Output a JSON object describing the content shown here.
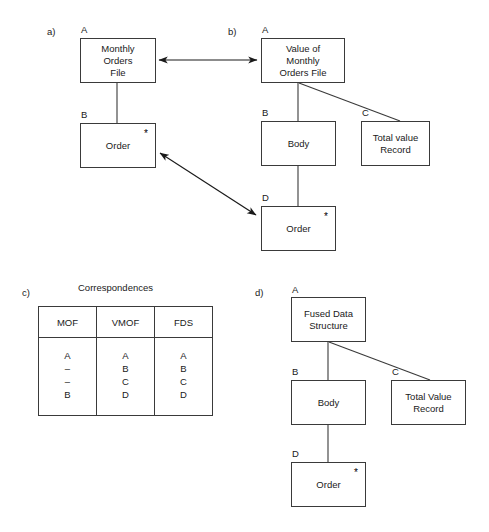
{
  "figure": {
    "background_color": "#ffffff",
    "line_color": "#3a3a3a",
    "text_color": "#1a1a1a"
  },
  "panels": {
    "a": {
      "tag": "a)",
      "nodes": [
        {
          "tag": "A",
          "label": "Monthly\nOrders\nFile",
          "star": false
        },
        {
          "tag": "B",
          "label": "Order",
          "star": true
        }
      ]
    },
    "b": {
      "tag": "b)",
      "nodes": [
        {
          "tag": "A",
          "label": "Value of\nMonthly\nOrders File",
          "star": false
        },
        {
          "tag": "B",
          "label": "Body",
          "star": false
        },
        {
          "tag": "C",
          "label": "Total value\nRecord",
          "star": false
        },
        {
          "tag": "D",
          "label": "Order",
          "star": true
        }
      ]
    },
    "c": {
      "tag": "c)",
      "title": "Correspondences",
      "table": {
        "headers": [
          "MOF",
          "VMOF",
          "FDS"
        ],
        "columns": [
          {
            "name": "MOF",
            "values": [
              "A",
              "–",
              "–",
              "B"
            ]
          },
          {
            "name": "VMOF",
            "values": [
              "A",
              "B",
              "C",
              "D"
            ]
          },
          {
            "name": "FDS",
            "values": [
              "A",
              "B",
              "C",
              "D"
            ]
          }
        ],
        "cells": [
          "A\n–\n–\nB",
          "A\nB\nC\nD",
          "A\nB\nC\nD"
        ]
      }
    },
    "d": {
      "tag": "d)",
      "nodes": [
        {
          "tag": "A",
          "label": "Fused Data\nStructure",
          "star": false
        },
        {
          "tag": "B",
          "label": "Body",
          "star": false
        },
        {
          "tag": "C",
          "label": "Total Value\nRecord",
          "star": false
        },
        {
          "tag": "D",
          "label": "Order",
          "star": true
        }
      ]
    }
  },
  "markers": {
    "star_glyph": "*"
  }
}
